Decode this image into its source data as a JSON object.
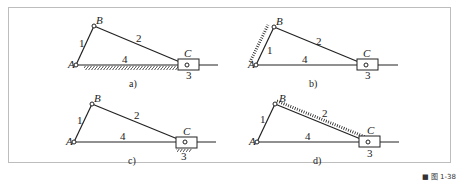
{
  "figure": {
    "figure_number": "■ 图 1-38",
    "panels": [
      {
        "id": "a",
        "caption": "a)",
        "fixed_link": "4",
        "points": {
          "A": "A",
          "B": "B",
          "C": "C"
        },
        "links": {
          "l1": "1",
          "l2": "2",
          "l3": "3",
          "l4": "4"
        }
      },
      {
        "id": "b",
        "caption": "b)",
        "fixed_link": "1",
        "points": {
          "A": "A",
          "B": "B",
          "C": "C"
        },
        "links": {
          "l1": "1",
          "l2": "2",
          "l3": "3",
          "l4": "4"
        }
      },
      {
        "id": "c",
        "caption": "c)",
        "fixed_link": "3",
        "points": {
          "A": "A",
          "B": "B",
          "C": "C"
        },
        "links": {
          "l1": "1",
          "l2": "2",
          "l3": "3",
          "l4": "4"
        }
      },
      {
        "id": "d",
        "caption": "d)",
        "fixed_link": "2",
        "points": {
          "A": "A",
          "B": "B",
          "C": "C"
        },
        "links": {
          "l1": "1",
          "l2": "2",
          "l3": "3",
          "l4": "4"
        }
      }
    ],
    "colors": {
      "line": "#222222",
      "frame": "#bdbdbd"
    }
  }
}
